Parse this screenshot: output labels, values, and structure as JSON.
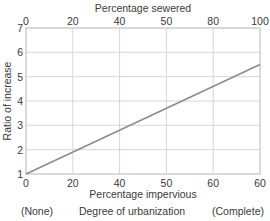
{
  "chart_data": {
    "type": "line",
    "title": "",
    "top_axis": {
      "label": "Percentage sewered",
      "ticks": [
        "0",
        "20",
        "40",
        "50",
        "80",
        "100"
      ]
    },
    "bottom_axis": {
      "label": "Percentage impervious",
      "ticks": [
        "0",
        "20",
        "40",
        "50",
        "60",
        "60"
      ]
    },
    "xlabel": "Percentage impervious",
    "ylabel": "Ratio of increase",
    "y_ticks": [
      "1",
      "2",
      "3",
      "4",
      "5",
      "6",
      "7"
    ],
    "ylim": [
      1,
      7
    ],
    "grid": true,
    "footer": {
      "left": "(None)",
      "center": "Degree of urbanization",
      "right": "(Complete)"
    },
    "series": [
      {
        "name": "Ratio of increase",
        "x_fraction": [
          0,
          1
        ],
        "values": [
          1.0,
          5.5
        ]
      }
    ]
  }
}
